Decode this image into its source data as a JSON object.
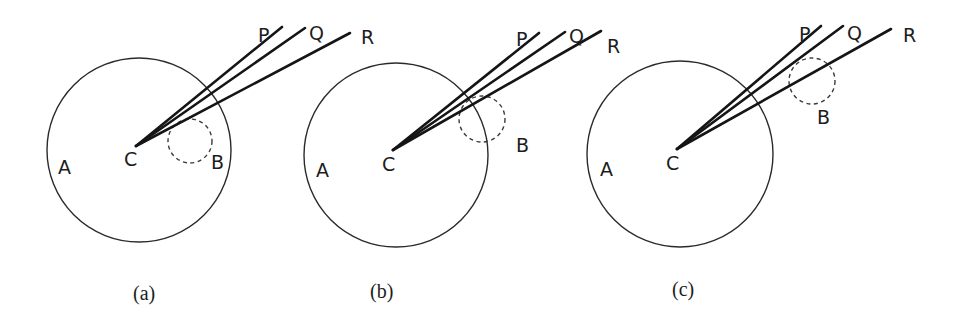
{
  "figure": {
    "panels": [
      {
        "caption": "(a)",
        "labels": {
          "A": "A",
          "B": "B",
          "C": "C",
          "P": "P",
          "Q": "Q",
          "R": "R"
        },
        "big_circle": {
          "cx": 139,
          "cy": 150,
          "r": 92
        },
        "small_circle": {
          "cx": 190,
          "cy": 141,
          "r": 22,
          "position": "inside"
        },
        "origin": {
          "x": 136,
          "y": 146
        },
        "rays": {
          "P": [
            282,
            27
          ],
          "Q": [
            305,
            28
          ],
          "R": [
            350,
            33
          ]
        }
      },
      {
        "caption": "(b)",
        "labels": {
          "A": "A",
          "B": "B",
          "C": "C",
          "P": "P",
          "Q": "Q",
          "R": "R"
        },
        "big_circle": {
          "cx": 396,
          "cy": 155,
          "r": 92
        },
        "small_circle": {
          "cx": 482,
          "cy": 119,
          "r": 23,
          "position": "on-boundary"
        },
        "origin": {
          "x": 393,
          "y": 150
        },
        "rays": {
          "P": [
            539,
            33
          ],
          "Q": [
            565,
            32
          ],
          "R": [
            601,
            31
          ]
        }
      },
      {
        "caption": "(c)",
        "labels": {
          "A": "A",
          "B": "B",
          "C": "C",
          "P": "P",
          "Q": "Q",
          "R": "R"
        },
        "big_circle": {
          "cx": 680,
          "cy": 154,
          "r": 93
        },
        "small_circle": {
          "cx": 812,
          "cy": 81,
          "r": 23,
          "position": "outside"
        },
        "origin": {
          "x": 677,
          "y": 149
        },
        "rays": {
          "P": [
            821,
            26
          ],
          "Q": [
            843,
            26
          ],
          "R": [
            891,
            29
          ]
        }
      }
    ]
  }
}
